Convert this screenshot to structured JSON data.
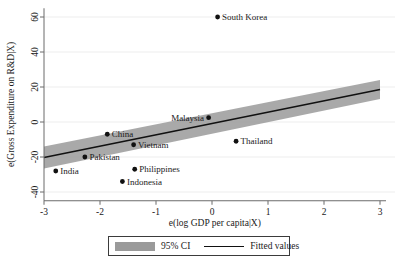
{
  "chart_data": {
    "type": "scatter",
    "title": "",
    "xlabel": "e(log GDP per capita|X)",
    "ylabel": "e(Gross Expenditure on R&D|X)",
    "xlim": [
      -3,
      3
    ],
    "ylim": [
      -45,
      65
    ],
    "xticks": [
      -3,
      -2,
      -1,
      0,
      1,
      2,
      3
    ],
    "xticklabels": [
      "-3",
      "-2",
      "-1",
      "0",
      "1",
      "2",
      "3"
    ],
    "yticks": [
      -40,
      -20,
      0,
      20,
      40,
      60
    ],
    "yticklabels": [
      "-40",
      "-20",
      "0",
      "20",
      "40",
      "60"
    ],
    "grid": "horizontal-faint",
    "legend_position": "below-axis-centered",
    "points": [
      {
        "label": "South Korea",
        "x": 0.1,
        "y": 60.0,
        "label_side": "right"
      },
      {
        "label": "Malaysia",
        "x": -0.06,
        "y": 2.5,
        "label_side": "left"
      },
      {
        "label": "Thailand",
        "x": 0.43,
        "y": -11.0,
        "label_side": "right"
      },
      {
        "label": "China",
        "x": -1.87,
        "y": -7.0,
        "label_side": "right"
      },
      {
        "label": "Vietnam",
        "x": -1.4,
        "y": -13.0,
        "label_side": "right"
      },
      {
        "label": "Pakistan",
        "x": -2.27,
        "y": -20.0,
        "label_side": "right"
      },
      {
        "label": "India",
        "x": -2.79,
        "y": -28.0,
        "label_side": "right"
      },
      {
        "label": "Philippines",
        "x": -1.38,
        "y": -27.0,
        "label_side": "right"
      },
      {
        "label": "Indonesia",
        "x": -1.6,
        "y": -34.0,
        "label_side": "right"
      }
    ],
    "fit_line": {
      "name": "Fitted values",
      "x_start": -3.0,
      "y_start": -20.3,
      "x_end": 3.0,
      "y_end": 18.6,
      "color": "#111111"
    },
    "confidence_band": {
      "name": "95% CI",
      "level": "95%",
      "color": "#9a9a9a",
      "x_start": -3.0,
      "x_end": 3.0,
      "upper_start": -14.0,
      "upper_end": 24.0,
      "lower_start": -26.5,
      "lower_end": 13.2
    }
  },
  "legend": {
    "ci_label": "95% CI",
    "fit_label": "Fitted values"
  }
}
